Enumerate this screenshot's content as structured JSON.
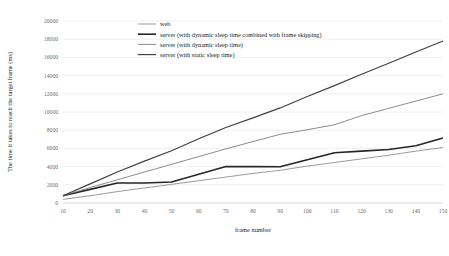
{
  "chart_data": {
    "type": "line",
    "title": "",
    "xlabel": "frame number",
    "ylabel": "The time it takes to reach the target frame (ms)",
    "x": [
      10,
      20,
      30,
      40,
      50,
      60,
      70,
      80,
      90,
      100,
      110,
      120,
      130,
      140,
      150
    ],
    "xlim": [
      10,
      150
    ],
    "ylim": [
      0,
      20000
    ],
    "xticks": [
      "10",
      "20",
      "30",
      "40",
      "50",
      "60",
      "70",
      "80",
      "90",
      "100",
      "110",
      "120",
      "130",
      "140",
      "150"
    ],
    "yticks": [
      "0",
      "2000",
      "4000",
      "6000",
      "8000",
      "10000",
      "12000",
      "14000",
      "16000",
      "18000",
      "20000"
    ],
    "grid": true,
    "legend_position": "top-center",
    "series": [
      {
        "name": "web",
        "color": "#808080",
        "width": 0.8,
        "values": [
          400,
          800,
          1250,
          1650,
          2050,
          2450,
          2850,
          3250,
          3600,
          4050,
          4450,
          4850,
          5250,
          5700,
          6100
        ]
      },
      {
        "name": "server (with dynamic sleep time combined with frame skipping)",
        "color": "#262626",
        "width": 1.6,
        "values": [
          800,
          1500,
          2200,
          2200,
          2300,
          3150,
          4000,
          4000,
          3980,
          4750,
          5520,
          5700,
          5880,
          6300,
          7150
        ]
      },
      {
        "name": "server (with dynamic sleep time)",
        "color": "#7f7f7f",
        "width": 0.9,
        "values": [
          800,
          1700,
          2550,
          3400,
          4250,
          5100,
          5950,
          6750,
          7550,
          8050,
          8600,
          9600,
          10400,
          11200,
          12000
        ]
      },
      {
        "name": "server (with static sleep time)",
        "color": "#404040",
        "width": 1.15,
        "values": [
          800,
          2100,
          3400,
          4600,
          5750,
          7050,
          8300,
          9350,
          10450,
          11700,
          12900,
          14150,
          15350,
          16600,
          17800
        ]
      }
    ]
  },
  "legend": {
    "entries": [
      {
        "label": "web"
      },
      {
        "label": "server (with dynamic sleep time combined with frame skipping)"
      },
      {
        "label": "server (with dynamic sleep time)"
      },
      {
        "label": "server (with static sleep time)"
      }
    ]
  },
  "colors": {
    "grid": "#e3e3e3",
    "axis_text": "#6b6b6b",
    "title_text": "#2b2b2b",
    "background": "#ffffff"
  }
}
